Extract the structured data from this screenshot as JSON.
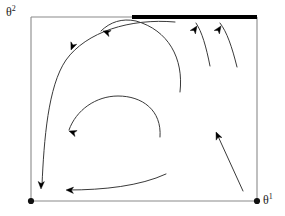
{
  "figure": {
    "type": "phase-portrait-diagram",
    "background_color": "#ffffff",
    "frame": {
      "color": "#8a8a8a",
      "stroke_width": 1.1,
      "x_left": 31,
      "x_right": 257,
      "y_top": 17,
      "y_bottom": 201
    },
    "axes": {
      "vertical": {
        "name": "theta2-axis-label",
        "base": "θ",
        "exponent": "2",
        "text": "θ2"
      },
      "horizontal": {
        "name": "theta1-axis-label",
        "base": "θ",
        "exponent": "1",
        "text": "θ1"
      }
    },
    "markers": [
      {
        "name": "origin-dot",
        "x": 31,
        "y": 201,
        "r": 3.1,
        "color": "#111111"
      },
      {
        "name": "corner-dot-theta1",
        "x": 257,
        "y": 201,
        "r": 3.1,
        "color": "#111111"
      }
    ],
    "thick_segment": {
      "name": "attractor-segment",
      "x_start": 132,
      "x_end": 257,
      "y": 17,
      "color": "#000000",
      "stroke_width": 4.2
    },
    "trajectories": [
      {
        "name": "trajectory-long-left-descent",
        "path": "M 175,22 C 130,18 86,32 66,60 C 48,86 44,140 42,185",
        "color": "#3a3a3a",
        "stroke_width": 1.0,
        "arrows": [
          {
            "name": "arrowhead-down-left-lower",
            "x": 41,
            "y": 189,
            "angle": 92,
            "size": 7.5
          },
          {
            "name": "arrowhead-down-upper-left",
            "x": 71,
            "y": 50,
            "angle": 112,
            "size": 7.5
          }
        ]
      },
      {
        "name": "trajectory-large-arc",
        "path": "M 180,92 C 184,58 168,30 136,21 C 122,18 110,22 101,31",
        "color": "#3a3a3a",
        "stroke_width": 1.0,
        "arrows": [
          {
            "name": "arrowhead-left-top-arc",
            "x": 103,
            "y": 31,
            "angle": 200,
            "size": 7.5
          }
        ]
      },
      {
        "name": "trajectory-inner-arc",
        "path": "M 160,137 C 162,110 142,96 118,96 C 96,96 76,110 69,130",
        "color": "#3a3a3a",
        "stroke_width": 1.0,
        "arrows": [
          {
            "name": "arrowhead-left-inner-arc",
            "x": 69,
            "y": 131,
            "angle": 200,
            "size": 7.5
          }
        ]
      },
      {
        "name": "trajectory-bottom-sweep",
        "path": "M 166,174 C 140,186 104,190 68,190",
        "color": "#3a3a3a",
        "stroke_width": 1.0,
        "arrows": [
          {
            "name": "arrowhead-left-bottom",
            "x": 66,
            "y": 190,
            "angle": 182,
            "size": 7.5
          }
        ]
      },
      {
        "name": "trajectory-right-inner-up",
        "path": "M 210,66 C 206,46 202,32 196,23",
        "color": "#3a3a3a",
        "stroke_width": 1.0,
        "arrows": [
          {
            "name": "arrowhead-up-right-inner",
            "x": 197,
            "y": 26,
            "angle": 304,
            "size": 7.5
          }
        ]
      },
      {
        "name": "trajectory-right-outer-up",
        "path": "M 237,67 C 232,47 227,32 220,23",
        "color": "#3a3a3a",
        "stroke_width": 1.0,
        "arrows": [
          {
            "name": "arrowhead-up-right-outer",
            "x": 221,
            "y": 26,
            "angle": 304,
            "size": 7.5
          }
        ]
      },
      {
        "name": "trajectory-lower-right-straight",
        "path": "M 243,191 L 217,134",
        "color": "#3a3a3a",
        "stroke_width": 1.0,
        "arrows": [
          {
            "name": "arrowhead-up-left-lower-right",
            "x": 216,
            "y": 132,
            "angle": 246,
            "size": 7.5
          }
        ]
      }
    ]
  }
}
